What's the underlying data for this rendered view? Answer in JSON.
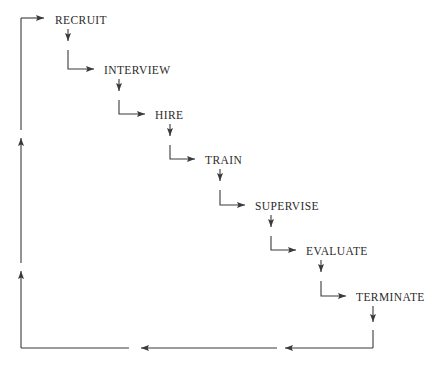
{
  "diagram": {
    "type": "staircase-flowchart",
    "orientation": "top-left to bottom-right cascade with feedback loop",
    "stroke_color": "#3a3a3a",
    "text_color": "#2b2b2b",
    "background_color": "#ffffff",
    "nodes": [
      {
        "id": "recruit",
        "label": "RECRUIT",
        "x": 55,
        "y": 14
      },
      {
        "id": "interview",
        "label": "INTERVIEW",
        "x": 104,
        "y": 64
      },
      {
        "id": "hire",
        "label": "HIRE",
        "x": 155,
        "y": 109
      },
      {
        "id": "train",
        "label": "TRAIN",
        "x": 205,
        "y": 154
      },
      {
        "id": "supervise",
        "label": "SUPERVISE",
        "x": 255,
        "y": 200
      },
      {
        "id": "evaluate",
        "label": "EVALUATE",
        "x": 306,
        "y": 245
      },
      {
        "id": "terminate",
        "label": "TERMINATE",
        "x": 356,
        "y": 291
      }
    ],
    "connections": [
      {
        "id": "entry-to-recruit",
        "from": "loop-return",
        "to": "recruit",
        "kind": "horizontal-arrow"
      },
      {
        "id": "recruit-to-interview",
        "from": "recruit",
        "to": "interview",
        "kind": "step-down-right"
      },
      {
        "id": "interview-to-hire",
        "from": "interview",
        "to": "hire",
        "kind": "step-down-right"
      },
      {
        "id": "hire-to-train",
        "from": "hire",
        "to": "train",
        "kind": "step-down-right"
      },
      {
        "id": "train-to-supervise",
        "from": "train",
        "to": "supervise",
        "kind": "step-down-right"
      },
      {
        "id": "supervise-to-evaluate",
        "from": "supervise",
        "to": "evaluate",
        "kind": "step-down-right"
      },
      {
        "id": "evaluate-to-terminate",
        "from": "evaluate",
        "to": "terminate",
        "kind": "step-down-right"
      },
      {
        "id": "terminate-to-loop",
        "from": "terminate",
        "to": "loop-return",
        "kind": "down-then-left"
      },
      {
        "id": "loop-return-to-recruit",
        "from": "loop-return",
        "to": "recruit",
        "kind": "left-then-up"
      }
    ],
    "feedback_loop": {
      "id": "return-path",
      "description": "Bottom rail runs leftward then up the left margin back to RECRUIT",
      "bottom_rail_y": 348,
      "left_rail_x": 21,
      "left_rail_top_y": 18,
      "arrow_markers_left_up": [
        130,
        263
      ],
      "arrow_markers_bottom_left": [
        277,
        133
      ]
    }
  }
}
